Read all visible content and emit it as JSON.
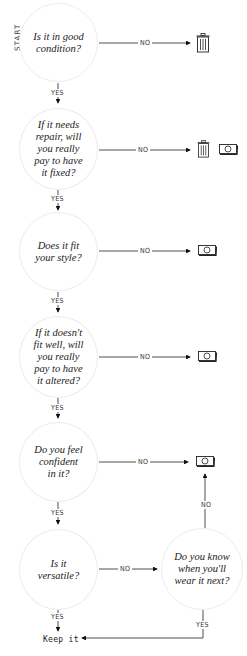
{
  "start_label": "START",
  "nodes": [
    {
      "id": "good-condition",
      "text": "Is it in good\ncondition?"
    },
    {
      "id": "repair",
      "text": "If it needs\nrepair, will\nyou really\npay to have\nit fixed?"
    },
    {
      "id": "style",
      "text": "Does it fit\nyour style?"
    },
    {
      "id": "alter",
      "text": "If it doesn't\nfit well, will\nyou really\npay to have\nit altered?"
    },
    {
      "id": "confident",
      "text": "Do you feel\nconfident\nin it?"
    },
    {
      "id": "versatile",
      "text": "Is it\nversatile?"
    },
    {
      "id": "wear-next",
      "text": "Do you know\nwhen you'll\nwear it next?"
    }
  ],
  "edge_labels": {
    "yes": "YES",
    "no": "NO"
  },
  "outcomes": {
    "keep": "Keep it",
    "trash_icon": "trash-icon",
    "money_icon": "money-icon"
  }
}
